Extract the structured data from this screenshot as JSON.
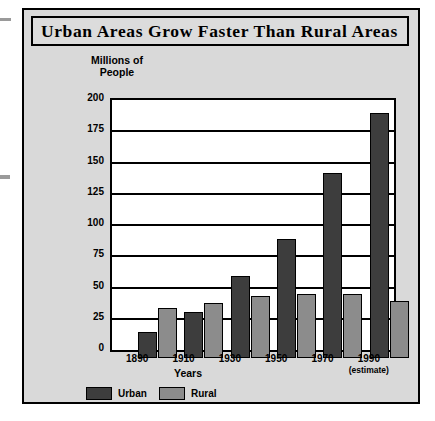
{
  "figure": {
    "title": "Urban Areas Grow Faster Than Rural Areas"
  },
  "chart_data": {
    "type": "bar",
    "title": "Urban Areas Grow Faster Than Rural Areas",
    "ylabel": "Millions of People",
    "xlabel": "Years",
    "categories": [
      "1890",
      "1910",
      "1930",
      "1950",
      "1970",
      "1990"
    ],
    "category_notes": [
      "",
      "",
      "",
      "",
      "",
      "(estimate)"
    ],
    "series": [
      {
        "name": "Urban",
        "color": "#3d3d3d",
        "values": [
          21,
          37,
          66,
          95,
          148,
          196
        ]
      },
      {
        "name": "Rural",
        "color": "#8c8c8c",
        "values": [
          40,
          44,
          50,
          51,
          51,
          46
        ]
      }
    ],
    "ylim": [
      0,
      200
    ],
    "yticks": [
      200,
      175,
      150,
      125,
      100,
      75,
      50,
      25,
      0
    ],
    "grid": true,
    "legend_position": "bottom-left"
  }
}
